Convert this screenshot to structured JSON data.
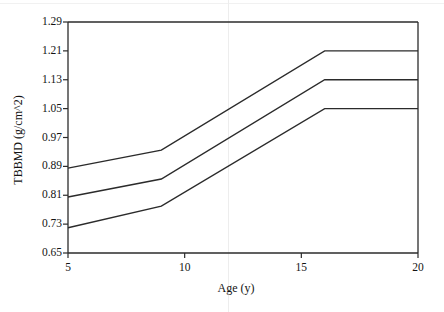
{
  "chart_data": {
    "type": "line",
    "title": "",
    "subtitle": "",
    "xlabel": "Age (y)",
    "ylabel": "TBBMD (g/cm^2)",
    "xlim": [
      5,
      20
    ],
    "ylim": [
      0.65,
      1.29
    ],
    "xticks": [
      5,
      10,
      15,
      20
    ],
    "yticks": [
      0.65,
      0.73,
      0.81,
      0.89,
      0.97,
      1.05,
      1.13,
      1.21,
      1.29
    ],
    "xtick_labels": [
      "5",
      "10",
      "15",
      "20"
    ],
    "ytick_labels": [
      "0.65",
      "0.73",
      "0.81",
      "0.89",
      "0.97",
      "1.05",
      "1.13",
      "1.21",
      "1.29"
    ],
    "grid": false,
    "legend": null,
    "legend_position": "none",
    "annotations": [],
    "line_color": "#2b2b2b",
    "background_color": "#ffffff",
    "x": [
      5,
      9,
      16,
      20
    ],
    "series": [
      {
        "name": "upper",
        "values": [
          0.885,
          0.935,
          1.21,
          1.21
        ]
      },
      {
        "name": "middle",
        "values": [
          0.805,
          0.855,
          1.13,
          1.13
        ]
      },
      {
        "name": "lower",
        "values": [
          0.72,
          0.78,
          1.05,
          1.05
        ]
      }
    ]
  }
}
